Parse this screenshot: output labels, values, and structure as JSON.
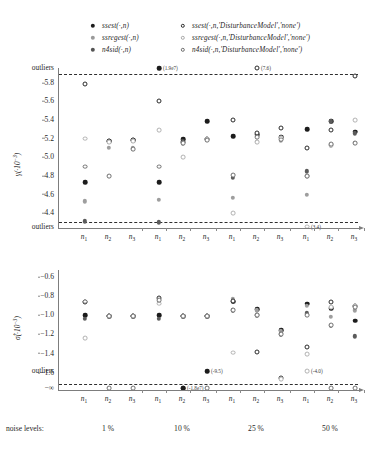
{
  "legend": {
    "entries": [
      {
        "marker": "filled-dark",
        "label": "ssest(·,n)"
      },
      {
        "marker": "filled-mid",
        "label": "ssregest(·,n)"
      },
      {
        "marker": "filled-med",
        "label": "n4sid(·,n)"
      },
      {
        "marker": "open-dark",
        "label": "ssest(·,n,'DisturbanceModel','none')"
      },
      {
        "marker": "open-mid",
        "label": "ssregest(·,n,'DisturbanceModel','none')"
      },
      {
        "marker": "open-med",
        "label": "n4sid(·,n,'DisturbanceModel','none')"
      }
    ]
  },
  "axes": {
    "noise_caption": "noise levels:",
    "groups": [
      "1 %",
      "10 %",
      "25 %",
      "50 %"
    ],
    "xticks": [
      "n1",
      "n2",
      "n3",
      "n1",
      "n2",
      "n3",
      "n1",
      "n2",
      "n3",
      "n1",
      "n2",
      "n3"
    ],
    "xtick_base": [
      "n",
      "n",
      "n",
      "n",
      "n",
      "n",
      "n",
      "n",
      "n",
      "n",
      "n",
      "n"
    ],
    "xtick_sub": [
      "1",
      "2",
      "3",
      "1",
      "2",
      "3",
      "1",
      "2",
      "3",
      "1",
      "2",
      "3"
    ]
  },
  "chart_data": [
    {
      "type": "scatter",
      "title": "",
      "id": "gamma",
      "ylabel": "γ(·10⁻³)",
      "ylabel_base": "γ(·10",
      "ylabel_exp": "−3",
      "ylabel_tail": ")",
      "xlabel": "",
      "ylim": [
        4.3,
        5.9
      ],
      "yticks": [
        5.8,
        5.6,
        5.4,
        5.2,
        5.0,
        4.8,
        4.6,
        4.4
      ],
      "ytick_labels": [
        "5.8",
        "5.6",
        "5.4",
        "5.2",
        "5.0",
        "4.8",
        "4.6",
        "4.4"
      ],
      "ytick_top_outlier": "outliers",
      "ytick_bottom_outlier": "outliers",
      "grid": false,
      "legend_position": "top",
      "dashed_lines": [
        5.9,
        4.3
      ],
      "categories": [
        "n1@1%",
        "n2@1%",
        "n3@1%",
        "n1@10%",
        "n2@10%",
        "n3@10%",
        "n1@25%",
        "n2@25%",
        "n3@25%",
        "n1@50%",
        "n2@50%",
        "n3@50%"
      ],
      "series": [
        {
          "name": "ssest(·,n)",
          "marker": "filled-dark",
          "values": [
            4.735,
            5.175,
            5.185,
            4.735,
            5.195,
            5.39,
            5.225,
            5.245,
            5.215,
            5.3,
            5.39,
            5.275
          ]
        },
        {
          "name": "ssregest(·,n)",
          "marker": "filled-mid",
          "values": [
            4.525,
            5.105,
            5.095,
            4.545,
            5.145,
            5.19,
            4.565,
            5.165,
            5.175,
            4.6,
            5.13,
            5.155
          ]
        },
        {
          "name": "n4sid(·,n)",
          "marker": "filled-med",
          "values": [
            4.31,
            5.165,
            5.18,
            4.3,
            5.175,
            5.2,
            4.78,
            5.24,
            5.22,
            4.85,
            5.385,
            5.26
          ]
        },
        {
          "name": "ssest(·,n,'DisturbanceModel','none')",
          "marker": "open-dark",
          "values": [
            5.79,
            5.175,
            5.185,
            5.6,
            5.16,
            5.2,
            5.4,
            5.26,
            5.31,
            5.1,
            5.29,
            5.875
          ]
        },
        {
          "name": "ssregest(·,n,'DisturbanceModel','none')",
          "marker": "open-mid",
          "values": [
            5.2,
            5.165,
            5.175,
            5.29,
            5.0,
            5.195,
            4.4,
            5.165,
            5.205,
            4.8,
            5.135,
            5.4
          ]
        },
        {
          "name": "n4sid(·,n,'DisturbanceModel','none')",
          "marker": "open-med",
          "values": [
            4.9,
            4.8,
            5.09,
            4.9,
            5.15,
            5.185,
            4.81,
            5.22,
            5.19,
            4.8,
            5.14,
            5.155
          ]
        }
      ],
      "annotations": [
        {
          "text": "(1.9e7)",
          "marker": "filled-dark",
          "x_category": "n1@10%",
          "y_zone": "top-outlier"
        },
        {
          "text": "(7.6)",
          "marker": "open-dark",
          "x_category": "n2@25%",
          "y_zone": "top-outlier"
        },
        {
          "text": "(3.4)",
          "marker": "open-mid",
          "x_category": "n1@50%",
          "y_zone": "bottom-outlier"
        }
      ]
    },
    {
      "type": "scatter",
      "title": "",
      "id": "sigma",
      "ylabel": "σ̂(·10⁻³)",
      "ylabel_base": "σ̂(·10",
      "ylabel_exp": "−3",
      "ylabel_tail": ")",
      "xlabel": "",
      "ylim": [
        -1.75,
        -0.55
      ],
      "yticks": [
        -0.6,
        -0.8,
        -1.0,
        -1.2,
        -1.4,
        -1.6
      ],
      "ytick_labels": [
        "−0.6",
        "−0.8",
        "−1.0",
        "−1.2",
        "−1.4",
        "−1.6"
      ],
      "ytick_outlier": "outliers",
      "ytick_inf": "−∞",
      "grid": false,
      "legend_position": "top",
      "dashed_lines": [
        -1.75
      ],
      "categories": [
        "n1@1%",
        "n2@1%",
        "n3@1%",
        "n1@10%",
        "n2@10%",
        "n3@10%",
        "n1@25%",
        "n2@25%",
        "n3@25%",
        "n1@50%",
        "n2@50%",
        "n3@50%"
      ],
      "series": [
        {
          "name": "ssest(·,n)",
          "marker": "filled-dark",
          "values": [
            -1.0,
            -1.01,
            -1.01,
            -1.0,
            -1.01,
            -1.01,
            -0.86,
            -0.94,
            -1.16,
            -0.88,
            -0.93,
            -1.06
          ]
        },
        {
          "name": "ssregest(·,n)",
          "marker": "filled-mid",
          "values": [
            -0.86,
            -1.01,
            -1.01,
            -0.86,
            -1.01,
            -1.01,
            -0.83,
            -0.95,
            -1.17,
            -0.9,
            -1.02,
            -0.95
          ]
        },
        {
          "name": "n4sid(·,n)",
          "marker": "filled-med",
          "values": [
            -1.04,
            -1.01,
            -1.01,
            -1.04,
            -1.01,
            -1.01,
            -0.95,
            -1.0,
            -1.2,
            -0.98,
            -1.11,
            -1.22
          ]
        },
        {
          "name": "ssest(·,n,'DisturbanceModel','none')",
          "marker": "open-dark",
          "values": [
            -0.86,
            -1.01,
            -1.01,
            -0.82,
            -1.01,
            -1.01,
            -0.85,
            -1.38,
            -1.66,
            -1.33,
            -0.86,
            -0.9
          ]
        },
        {
          "name": "ssregest(·,n,'DisturbanceModel','none')",
          "marker": "open-mid",
          "values": [
            -1.24,
            -1.01,
            -1.01,
            -0.88,
            -1.01,
            -1.01,
            -1.39,
            -1.0,
            -1.67,
            -1.41,
            -0.92,
            -0.9
          ]
        },
        {
          "name": "n4sid(·,n,'DisturbanceModel','none')",
          "marker": "open-med",
          "values": [
            -0.86,
            -1.01,
            -1.01,
            -0.84,
            -1.01,
            -1.01,
            -0.95,
            -1.0,
            -1.2,
            -1.0,
            -1.1,
            -0.92
          ]
        }
      ],
      "annotations": [
        {
          "text": "(-9.5)",
          "marker": "filled-dark",
          "x_category": "n3@10%",
          "y_zone": "outlier"
        },
        {
          "text": "(-1.8e7)",
          "marker": "filled-dark",
          "x_category": "n2@10%",
          "y_zone": "neg-inf"
        },
        {
          "text": "(-4.0)",
          "marker": "open-mid",
          "x_category": "n1@50%",
          "y_zone": "outlier"
        }
      ],
      "inf_points": [
        "n2@1%",
        "n3@1%",
        "n2@10%",
        "n3@10%",
        "n2@50%",
        "n3@50%"
      ]
    }
  ]
}
